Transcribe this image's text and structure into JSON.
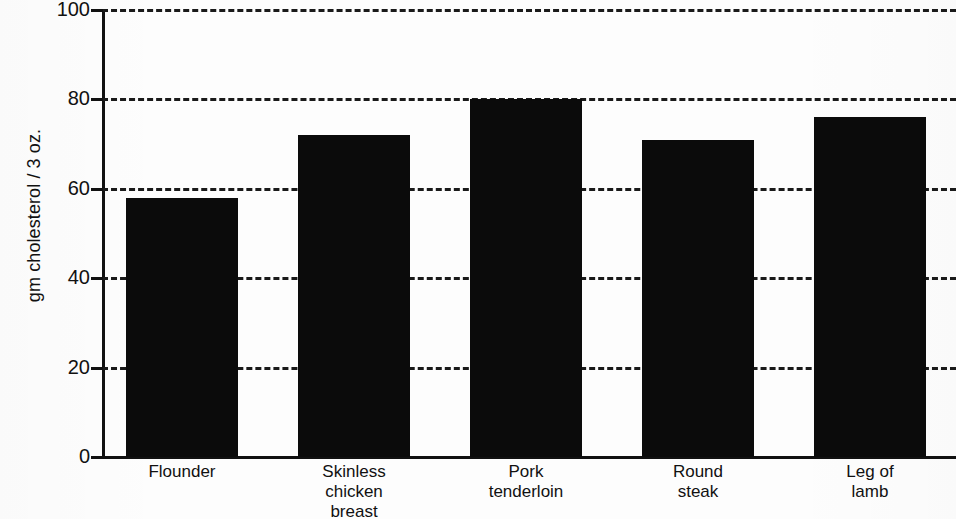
{
  "chart_data": {
    "type": "bar",
    "title": "",
    "subtitle": "",
    "xlabel": "",
    "ylabel": "gm cholesterol / 3 oz.",
    "categories": [
      "Flounder",
      "Skinless chicken breast",
      "Pork tenderloin",
      "Round steak",
      "Leg of lamb"
    ],
    "category_lines": [
      [
        "Flounder"
      ],
      [
        "Skinless",
        "chicken",
        "breast"
      ],
      [
        "Pork",
        "tenderloin"
      ],
      [
        "Round",
        "steak"
      ],
      [
        "Leg of",
        "lamb"
      ]
    ],
    "values": [
      58,
      72,
      80,
      71,
      76
    ],
    "ylim": [
      0,
      100
    ],
    "ytick_labels": [
      "0",
      "20",
      "40",
      "60",
      "80",
      "100"
    ],
    "ytick_values": [
      0,
      20,
      40,
      60,
      80,
      100
    ],
    "grid": "horizontal-dashed",
    "legend": "none",
    "bar_color": "#0b0b0b",
    "grid_color": "#1a1a1a",
    "axis_color": "#111111",
    "background_color": "#fdfdfd"
  }
}
